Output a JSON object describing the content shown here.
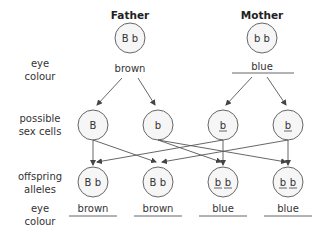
{
  "parents": [
    {
      "label": "Father",
      "alleles": "B b",
      "eye_colour": "brown",
      "eye_colour_underlined": false
    },
    {
      "label": "Mother",
      "alleles": "b b",
      "eye_colour": "blue",
      "eye_colour_underlined": true
    }
  ],
  "row_labels": {
    "parent_eye_colour": [
      "eye",
      "colour"
    ],
    "sex_cells": [
      "possible",
      "sex cells"
    ],
    "offspring_alleles": [
      "offspring",
      "alleles"
    ],
    "offspring_eye_colour": [
      "eye",
      "colour"
    ]
  },
  "sex_cells": [
    {
      "allele": "B",
      "parent": "Father",
      "underlined": false
    },
    {
      "allele": "b",
      "parent": "Father",
      "underlined": false
    },
    {
      "allele": "b",
      "parent": "Mother",
      "underlined": true
    },
    {
      "allele": "b",
      "parent": "Mother",
      "underlined": true
    }
  ],
  "offspring": [
    {
      "alleles": [
        "B",
        "b"
      ],
      "underlined": [
        false,
        false
      ],
      "eye_colour": "brown"
    },
    {
      "alleles": [
        "B",
        "b"
      ],
      "underlined": [
        false,
        false
      ],
      "eye_colour": "brown"
    },
    {
      "alleles": [
        "b",
        "b"
      ],
      "underlined": [
        true,
        true
      ],
      "eye_colour": "blue"
    },
    {
      "alleles": [
        "b",
        "b"
      ],
      "underlined": [
        true,
        true
      ],
      "eye_colour": "blue"
    }
  ],
  "crosses": [
    {
      "from_sex_cell": 0,
      "to_offspring": 0
    },
    {
      "from_sex_cell": 0,
      "to_offspring": 1
    },
    {
      "from_sex_cell": 1,
      "to_offspring": 2
    },
    {
      "from_sex_cell": 1,
      "to_offspring": 3
    },
    {
      "from_sex_cell": 2,
      "to_offspring": 0
    },
    {
      "from_sex_cell": 2,
      "to_offspring": 2
    },
    {
      "from_sex_cell": 3,
      "to_offspring": 1
    },
    {
      "from_sex_cell": 3,
      "to_offspring": 3
    }
  ],
  "colors": {
    "stroke": "#555555",
    "circle_fill": "#f6f6f6",
    "text": "#333333"
  }
}
